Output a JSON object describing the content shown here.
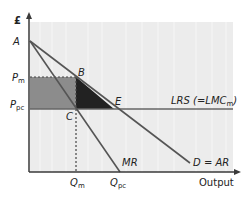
{
  "diagram": {
    "type": "monopoly-vs-perfect-competition",
    "y_axis_label": "£",
    "x_axis_label": "Output",
    "points": {
      "A": "A",
      "B": "B",
      "C": "C",
      "E": "E"
    },
    "y_ticks": [
      {
        "main": "P",
        "sub": "m"
      },
      {
        "main": "P",
        "sub": "pc"
      }
    ],
    "x_ticks": [
      {
        "main": "Q",
        "sub": "m"
      },
      {
        "main": "Q",
        "sub": "pc"
      }
    ],
    "curves": {
      "mr": "MR",
      "demand": "D = AR",
      "lrs_main": "LRS (=LMC",
      "lrs_sub": "m",
      "lrs_close": ")"
    },
    "colors": {
      "plot_bg": "#ececec",
      "axis": "#3a3a3a",
      "curve": "#555555",
      "lrs_line": "#666666",
      "rect_fill": "#8c8c8c",
      "triangle_fill": "#222222"
    }
  }
}
